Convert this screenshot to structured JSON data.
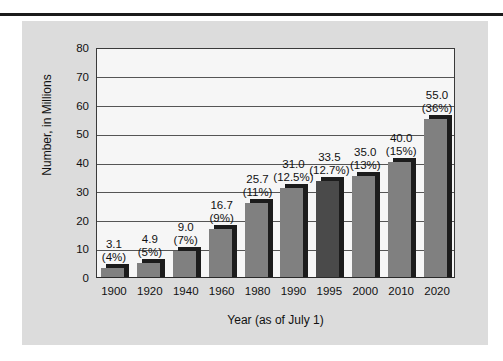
{
  "chart_data": {
    "type": "bar",
    "title": "",
    "xlabel": "Year (as of July 1)",
    "ylabel": "Number, in Millions",
    "categories": [
      "1900",
      "1920",
      "1940",
      "1960",
      "1980",
      "1990",
      "1995",
      "2000",
      "2010",
      "2020"
    ],
    "values": [
      3.1,
      4.9,
      9.0,
      16.7,
      25.7,
      31.0,
      33.5,
      35.0,
      40.0,
      55.0
    ],
    "value_labels": [
      "3.1",
      "4.9",
      "9.0",
      "16.7",
      "25.7",
      "31.0",
      "33.5",
      "35.0",
      "40.0",
      "55.0"
    ],
    "percent_labels": [
      "(4%)",
      "(5%)",
      "(7%)",
      "(9%)",
      "(11%)",
      "(12.5%)",
      "(12.7%)",
      "(13%)",
      "(15%)",
      "(36%)"
    ],
    "highlighted_category": "1995",
    "ylim": [
      0,
      80
    ],
    "yticks": [
      "0",
      "10",
      "20",
      "30",
      "40",
      "50",
      "60",
      "70",
      "80"
    ],
    "grid": true,
    "legend": "none",
    "bar_color": "#808080",
    "bar_highlight_color": "#4a4a4a",
    "bar_shadow_color": "#1c1c1c",
    "panel_color": "#dcdcdc",
    "plot_background": "#f6f6f6",
    "axis_color": "#3a3a3a"
  }
}
